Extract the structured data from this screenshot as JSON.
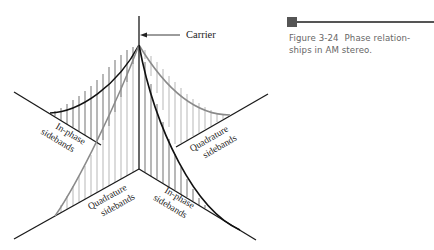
{
  "figure": {
    "number": "Figure 3-24",
    "caption_text": "Phase relation-ships in AM stereo.",
    "caption_line1_num": "Figure 3-24",
    "caption_line1_rest": "Phase relation-",
    "caption_line2": "ships in AM stereo.",
    "marker_color": "#555555"
  },
  "diagram": {
    "carrier_label": "Carrier",
    "labels": {
      "upper_left_line1": "In-phase",
      "upper_left_line2": "sidebands",
      "upper_right_line1": "Quadrature",
      "upper_right_line2": "sidebands",
      "lower_left_line1": "Quadrature",
      "lower_left_line2": "sidebands",
      "lower_right_line1": "In-phase",
      "lower_right_line2": "sidebands"
    },
    "colors": {
      "axis": "#1a1a1a",
      "in_phase_curve": "#111111",
      "quadrature_curve": "#8a8a8a",
      "hatch_in_phase": "#333333",
      "hatch_quadrature": "#999999"
    }
  }
}
